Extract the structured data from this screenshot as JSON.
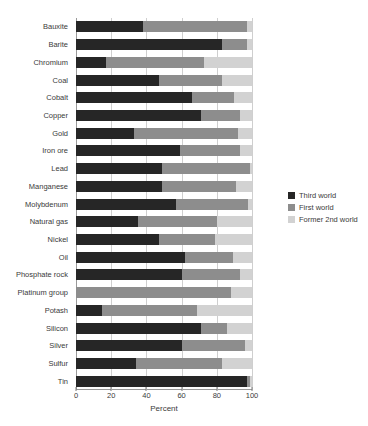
{
  "chart_data": {
    "type": "bar",
    "orientation": "horizontal",
    "stacked": true,
    "title": "",
    "xlabel": "Percent",
    "ylabel": "",
    "xlim": [
      0,
      100
    ],
    "xticks": [
      0,
      20,
      40,
      60,
      80,
      100
    ],
    "grid": "vertical",
    "legend_position": "right",
    "categories": [
      "Bauxite",
      "Barite",
      "Chromium",
      "Coal",
      "Cobalt",
      "Copper",
      "Gold",
      "Iron ore",
      "Lead",
      "Manganese",
      "Molybdenum",
      "Natural gas",
      "Nickel",
      "Oil",
      "Phosphate rock",
      "Platinum group",
      "Potash",
      "Silicon",
      "Silver",
      "Sulfur",
      "Tin"
    ],
    "series": [
      {
        "name": "Third world",
        "color": "#262626",
        "values": [
          38,
          83,
          17,
          47,
          66,
          71,
          33,
          59,
          49,
          49,
          57,
          35,
          47,
          62,
          60,
          0,
          15,
          71,
          60,
          34,
          97
        ]
      },
      {
        "name": "First world",
        "color": "#8d8d8d",
        "values": [
          59,
          14,
          56,
          36,
          24,
          22,
          59,
          34,
          50,
          42,
          41,
          45,
          32,
          27,
          33,
          88,
          54,
          15,
          36,
          49,
          2
        ]
      },
      {
        "name": "Former 2nd world",
        "color": "#d2d2d2",
        "values": [
          3,
          3,
          27,
          17,
          10,
          7,
          8,
          7,
          1,
          9,
          2,
          20,
          21,
          11,
          7,
          12,
          31,
          14,
          4,
          17,
          1
        ]
      }
    ]
  },
  "legend": {
    "items": [
      {
        "label": "Third world",
        "color": "#262626"
      },
      {
        "label": "First world",
        "color": "#8d8d8d"
      },
      {
        "label": "Former 2nd world",
        "color": "#d2d2d2"
      }
    ]
  }
}
